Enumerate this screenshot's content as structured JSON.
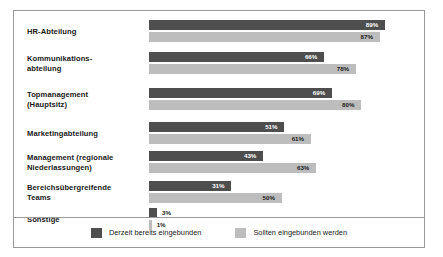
{
  "chart_data": {
    "type": "bar",
    "orientation": "horizontal",
    "title": "",
    "subtitle": "",
    "xlabel": "",
    "ylabel": "",
    "xlim": [
      0,
      100
    ],
    "grid": false,
    "legend_position": "bottom",
    "value_suffix": "%",
    "categories": [
      "HR-Abteilung",
      "Kommunikations-\nabteilung",
      "Topmanagement\n(Hauptsitz)",
      "Marketingabteilung",
      "Management (regionale\nNiederlassungen)",
      "Bereichsübergreifende\nTeams",
      "Sonstige"
    ],
    "series": [
      {
        "name": "Derzeit bereits eingebunden",
        "color": "#4e4e4e",
        "values": [
          89,
          66,
          69,
          51,
          43,
          31,
          3
        ],
        "labels": [
          "89%",
          "66%",
          "69%",
          "51%",
          "43%",
          "31%",
          "3%"
        ]
      },
      {
        "name": "Sollten eingebunden werden",
        "color": "#bdbdbd",
        "values": [
          87,
          78,
          80,
          61,
          63,
          50,
          1
        ],
        "labels": [
          "87%",
          "78%",
          "80%",
          "61%",
          "63%",
          "50%",
          "1%"
        ]
      }
    ]
  },
  "legend": {
    "items": [
      {
        "label": "Derzeit bereits eingebunden",
        "swatch": "dark"
      },
      {
        "label": "Sollten eingebunden werden",
        "swatch": "light"
      }
    ]
  },
  "colors": {
    "series_dark": "#4e4e4e",
    "series_light": "#bdbdbd",
    "frame_border": "#9a9a9a",
    "text": "#1a1a1a",
    "background": "#ffffff"
  }
}
